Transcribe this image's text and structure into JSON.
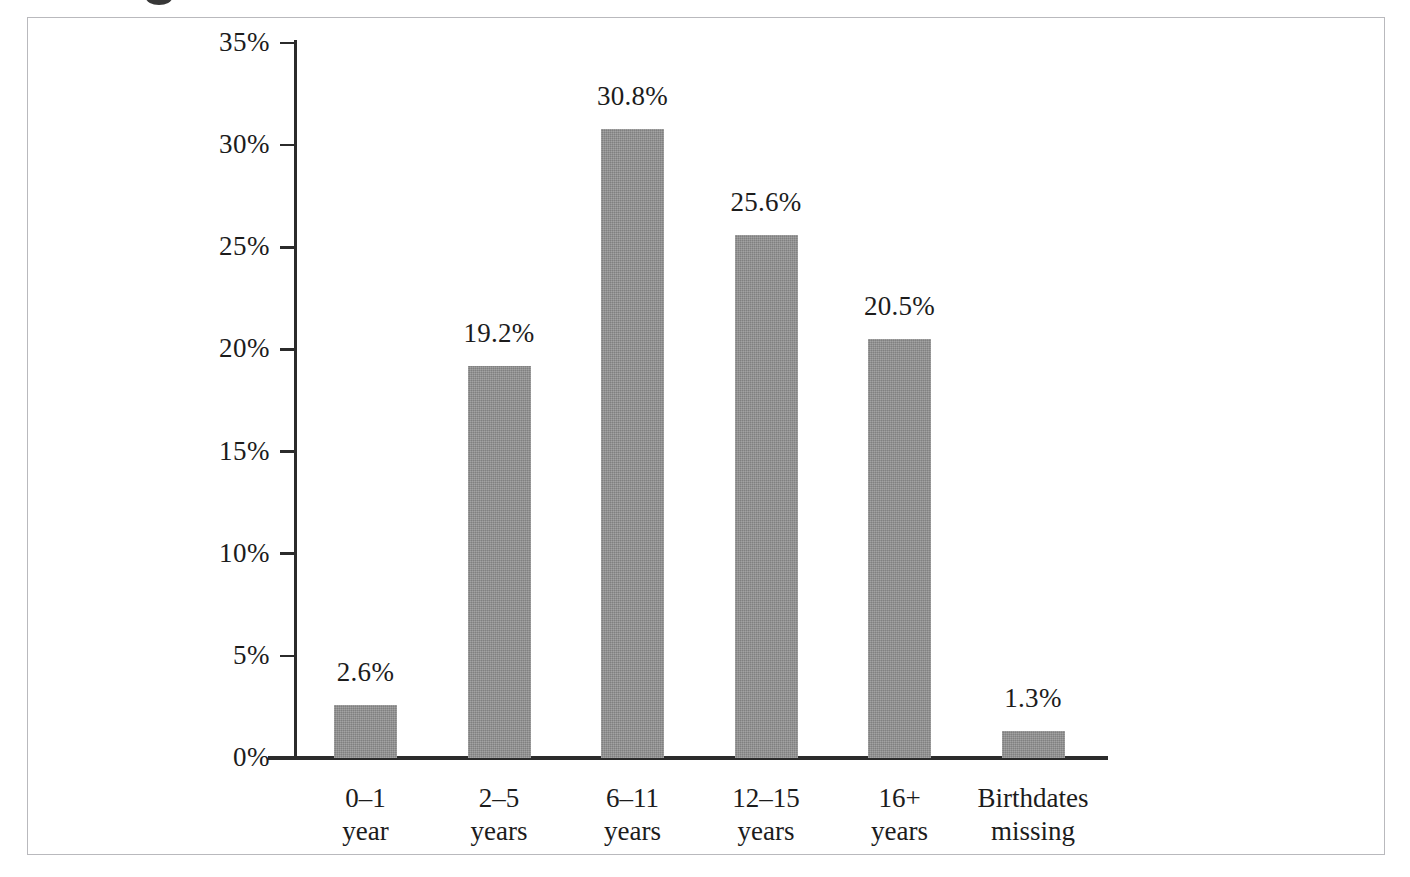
{
  "figure": {
    "frame": {
      "border_color": "#b9b9bd"
    },
    "background": "#ffffff",
    "bar_color": "#8c8c8c",
    "axis_color": "#2b2b2b",
    "text_color": "#1c1c1c"
  },
  "chart_data": {
    "type": "bar",
    "title": "",
    "subtitle": "",
    "xlabel": "",
    "ylabel": "",
    "categories": [
      "0–1 year",
      "2–5 years",
      "6–11 years",
      "12–15 years",
      "16+ years",
      "Birthdates missing"
    ],
    "category_lines": [
      [
        "0–1",
        "year"
      ],
      [
        "2–5",
        "years"
      ],
      [
        "6–11",
        "years"
      ],
      [
        "12–15",
        "years"
      ],
      [
        "16+",
        "years"
      ],
      [
        "Birthdates",
        "missing"
      ]
    ],
    "values": [
      2.6,
      19.2,
      30.8,
      25.6,
      20.5,
      1.3
    ],
    "data_labels": [
      "2.6%",
      "19.2%",
      "30.8%",
      "25.6%",
      "20.5%",
      "1.3%"
    ],
    "ylim": [
      0,
      35
    ],
    "ytick_values": [
      0,
      5,
      10,
      15,
      20,
      25,
      30,
      35
    ],
    "ytick_labels": [
      "0%",
      "5%",
      "10%",
      "15%",
      "20%",
      "25%",
      "30%",
      "35%"
    ],
    "grid": false,
    "legend": null,
    "legend_position": "none",
    "series": [
      {
        "name": "Percent of children",
        "values": [
          2.6,
          19.2,
          30.8,
          25.6,
          20.5,
          1.3
        ]
      }
    ],
    "annotations": []
  }
}
